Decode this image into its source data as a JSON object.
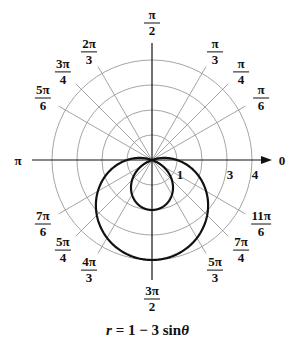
{
  "chart_data": {
    "type": "polar-line",
    "title": "",
    "caption": "r = 1 − 3 sinθ",
    "equation": {
      "a": 1,
      "b": -3,
      "func": "sin"
    },
    "radial_ticks": [
      {
        "value": 1,
        "label": "1"
      },
      {
        "value": 3,
        "label": "3"
      },
      {
        "value": 4,
        "label": "4"
      }
    ],
    "radial_gridlines": [
      1,
      2,
      3,
      4
    ],
    "rlim": [
      0,
      4
    ],
    "angle_labels": [
      {
        "angle_deg": 0,
        "label": "0"
      },
      {
        "angle_deg": 30,
        "num": "π",
        "den": "6"
      },
      {
        "angle_deg": 45,
        "num": "π",
        "den": "4"
      },
      {
        "angle_deg": 60,
        "num": "π",
        "den": "3"
      },
      {
        "angle_deg": 90,
        "num": "π",
        "den": "2"
      },
      {
        "angle_deg": 120,
        "num": "2π",
        "den": "3"
      },
      {
        "angle_deg": 135,
        "num": "3π",
        "den": "4"
      },
      {
        "angle_deg": 150,
        "num": "5π",
        "den": "6"
      },
      {
        "angle_deg": 180,
        "label": "π"
      },
      {
        "angle_deg": 210,
        "num": "7π",
        "den": "6"
      },
      {
        "angle_deg": 225,
        "num": "5π",
        "den": "4"
      },
      {
        "angle_deg": 240,
        "num": "4π",
        "den": "3"
      },
      {
        "angle_deg": 270,
        "num": "3π",
        "den": "2"
      },
      {
        "angle_deg": 300,
        "num": "5π",
        "den": "3"
      },
      {
        "angle_deg": 315,
        "num": "7π",
        "den": "4"
      },
      {
        "angle_deg": 330,
        "num": "11π",
        "den": "6"
      }
    ],
    "sample_points": [
      {
        "theta": "0",
        "r": 1
      },
      {
        "theta": "π/6",
        "r": -0.5
      },
      {
        "theta": "π/2",
        "r": -2
      },
      {
        "theta": "5π/6",
        "r": -0.5
      },
      {
        "theta": "π",
        "r": 1
      },
      {
        "theta": "7π/6",
        "r": 2.5
      },
      {
        "theta": "3π/2",
        "r": 4
      },
      {
        "theta": "11π/6",
        "r": 2.5
      }
    ],
    "grid": true,
    "colors": {
      "curve": "#111111",
      "grid": "#9a9a9a",
      "axis": "#111111"
    }
  }
}
